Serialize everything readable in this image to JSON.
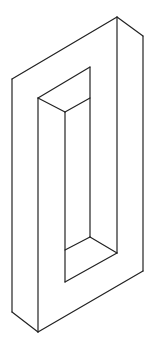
{
  "figure": {
    "stroke_color": "#222222",
    "background": "#ffffff",
    "lines": [
      {
        "name": "outer-top-left-edge",
        "x1": 12,
        "y1": 79,
        "x2": 117,
        "y2": 17
      },
      {
        "name": "outer-top-right-edge",
        "x1": 117,
        "y1": 17,
        "x2": 143,
        "y2": 36
      },
      {
        "name": "outer-left-edge",
        "x1": 12,
        "y1": 79,
        "x2": 12,
        "y2": 312
      },
      {
        "name": "outer-bottom-left-edge",
        "x1": 12,
        "y1": 312,
        "x2": 38,
        "y2": 332
      },
      {
        "name": "outer-bottom-edge",
        "x1": 38,
        "y1": 332,
        "x2": 143,
        "y2": 271
      },
      {
        "name": "outer-right-edge",
        "x1": 143,
        "y1": 36,
        "x2": 143,
        "y2": 271
      },
      {
        "name": "front-right-vertical",
        "x1": 117,
        "y1": 17,
        "x2": 117,
        "y2": 253
      },
      {
        "name": "front-left-vertical",
        "x1": 38,
        "y1": 98,
        "x2": 38,
        "y2": 332
      },
      {
        "name": "inner-top-edge",
        "x1": 38,
        "y1": 98,
        "x2": 90,
        "y2": 67
      },
      {
        "name": "inner-back-vertical",
        "x1": 90,
        "y1": 67,
        "x2": 90,
        "y2": 237
      },
      {
        "name": "inner-top-bevel",
        "x1": 38,
        "y1": 98,
        "x2": 65,
        "y2": 112
      },
      {
        "name": "inner-top-bevel-right",
        "x1": 65,
        "y1": 112,
        "x2": 90,
        "y2": 98
      },
      {
        "name": "inner-front-vertical",
        "x1": 65,
        "y1": 112,
        "x2": 65,
        "y2": 282
      },
      {
        "name": "inner-bottom-edge",
        "x1": 65,
        "y1": 282,
        "x2": 117,
        "y2": 253
      },
      {
        "name": "inner-bottom-bevel",
        "x1": 65,
        "y1": 250,
        "x2": 90,
        "y2": 237
      },
      {
        "name": "inner-bottom-bevel-right",
        "x1": 90,
        "y1": 237,
        "x2": 117,
        "y2": 253
      }
    ]
  }
}
